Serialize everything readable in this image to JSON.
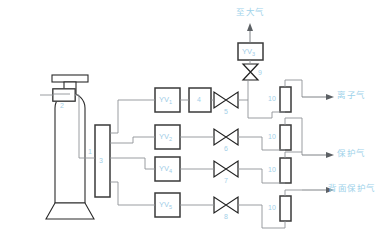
{
  "diagram": {
    "colors": {
      "label_blue": "#a3cfe8",
      "pipe_gray": "#8e9296",
      "outline_dark": "#2a2a2a",
      "background": "#ffffff"
    },
    "equipment": [
      {
        "id": "cylinder",
        "tag": "1",
        "name": "gas-cylinder"
      },
      {
        "id": "regulator",
        "tag": "2",
        "name": "pressure-regulator"
      },
      {
        "id": "manifold",
        "tag": "3",
        "name": "distribution-manifold"
      },
      {
        "id": "filter",
        "tag": "4",
        "name": "inline-filter"
      }
    ],
    "solenoid_valves": [
      {
        "id": "yv1",
        "base": "YV",
        "sub": "1"
      },
      {
        "id": "yv2",
        "base": "YV",
        "sub": "2"
      },
      {
        "id": "yv3",
        "base": "YV",
        "sub": "3"
      },
      {
        "id": "yv4",
        "base": "YV",
        "sub": "4"
      },
      {
        "id": "yv5",
        "base": "YV",
        "sub": "5"
      }
    ],
    "manual_valves": [
      {
        "id": "v5",
        "tag": "5"
      },
      {
        "id": "v6",
        "tag": "6"
      },
      {
        "id": "v7",
        "tag": "7"
      },
      {
        "id": "v8",
        "tag": "8"
      },
      {
        "id": "v9",
        "tag": "9"
      }
    ],
    "flowmeters": [
      {
        "id": "fm1",
        "tag": "10"
      },
      {
        "id": "fm2",
        "tag": "10"
      },
      {
        "id": "fm3",
        "tag": "10"
      },
      {
        "id": "fm4",
        "tag": "10"
      }
    ],
    "outputs": [
      {
        "id": "vent",
        "label": "至大气"
      },
      {
        "id": "plasma",
        "label": "离子气"
      },
      {
        "id": "shield",
        "label": "保护气"
      },
      {
        "id": "back_shield",
        "label": "背面保护气"
      }
    ]
  }
}
